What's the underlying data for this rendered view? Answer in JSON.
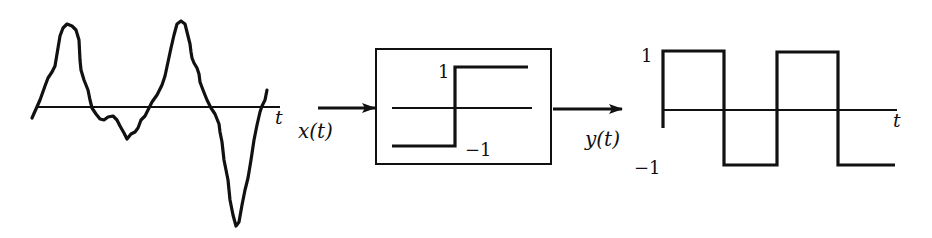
{
  "diagram": {
    "type": "signal-flow",
    "input_plot": {
      "axis_label": "t",
      "signal": "irregular-waveform"
    },
    "input_signal_label": "x(t)",
    "block": {
      "type": "sign-nonlinearity",
      "upper_level_label": "1",
      "lower_level_label": "−1"
    },
    "output_signal_label": "y(t)",
    "output_plot": {
      "axis_label": "t",
      "y_high_label": "1",
      "y_low_label": "−1",
      "signal": "square-wave"
    },
    "colors": {
      "stroke": "#111111",
      "background": "#ffffff"
    }
  }
}
